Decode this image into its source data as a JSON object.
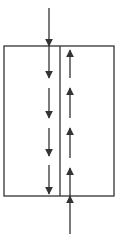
{
  "diagram": {
    "type": "counter-current flow schematic",
    "stroke_color": "#333333",
    "background": "#ffffff",
    "vessel": {
      "x": 4,
      "y": 46,
      "width": 110,
      "height": 150,
      "divider_x": 60
    },
    "inlet_top": {
      "x": 49,
      "y1": 8,
      "y2": 46,
      "direction": "down"
    },
    "inlet_bottom": {
      "x": 70,
      "y1": 234,
      "y2": 196,
      "direction": "up"
    },
    "left_channel_arrows": [
      {
        "x": 49,
        "y1": 46,
        "y2": 78,
        "direction": "down"
      },
      {
        "x": 49,
        "y1": 88,
        "y2": 118,
        "direction": "down"
      },
      {
        "x": 49,
        "y1": 128,
        "y2": 156,
        "direction": "down"
      },
      {
        "x": 49,
        "y1": 165,
        "y2": 194,
        "direction": "down"
      }
    ],
    "right_channel_arrows": [
      {
        "x": 70,
        "y1": 78,
        "y2": 50,
        "direction": "up"
      },
      {
        "x": 70,
        "y1": 118,
        "y2": 88,
        "direction": "up"
      },
      {
        "x": 70,
        "y1": 158,
        "y2": 128,
        "direction": "up"
      },
      {
        "x": 70,
        "y1": 196,
        "y2": 168,
        "direction": "up"
      }
    ]
  }
}
